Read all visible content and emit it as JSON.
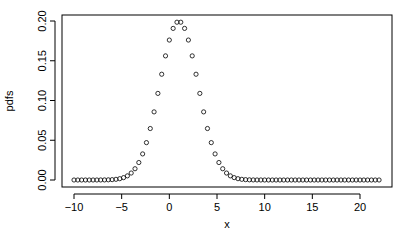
{
  "chart_data": {
    "type": "scatter",
    "title": "",
    "xlabel": "x",
    "ylabel": "pdfs",
    "xlim": [
      -10,
      22
    ],
    "ylim": [
      0,
      0.2
    ],
    "grid": false,
    "legend": null,
    "marker": "open-circle",
    "x_ticks": [
      -10,
      -5,
      0,
      5,
      10,
      15,
      20
    ],
    "x_tick_labels": [
      "−10",
      "−5",
      "0",
      "5",
      "10",
      "15",
      "20"
    ],
    "y_ticks": [
      0.0,
      0.05,
      0.1,
      0.15,
      0.2
    ],
    "y_tick_labels": [
      "0.00",
      "0.05",
      "0.10",
      "0.15",
      "0.20"
    ],
    "series": [
      {
        "name": "pdfs",
        "x": [
          -10.0,
          -9.6,
          -9.2,
          -8.8,
          -8.4,
          -8.0,
          -7.6,
          -7.2,
          -6.8,
          -6.4,
          -6.0,
          -5.6,
          -5.2,
          -4.8,
          -4.4,
          -4.0,
          -3.6,
          -3.2,
          -2.8,
          -2.4,
          -2.0,
          -1.6,
          -1.2,
          -0.8,
          -0.4,
          0.0,
          0.4,
          0.8,
          1.2,
          1.6,
          2.0,
          2.4,
          2.8,
          3.2,
          3.6,
          4.0,
          4.4,
          4.8,
          5.2,
          5.6,
          6.0,
          6.4,
          6.8,
          7.2,
          7.6,
          8.0,
          8.4,
          8.8,
          9.2,
          9.6,
          10.0,
          10.4,
          10.8,
          11.2,
          11.6,
          12.0,
          12.4,
          12.8,
          13.2,
          13.6,
          14.0,
          14.4,
          14.8,
          15.2,
          15.6,
          16.0,
          16.4,
          16.8,
          17.2,
          17.6,
          18.0,
          18.4,
          18.8,
          19.2,
          19.6,
          20.0,
          20.4,
          20.8,
          21.2,
          21.6,
          22.0
        ],
        "y": [
          0.0,
          0.0,
          0.0,
          0.0,
          0.0,
          0.0,
          0.0,
          0.0,
          0.0,
          0.0001,
          0.0002,
          0.0004,
          0.0008,
          0.0015,
          0.003,
          0.0054,
          0.0091,
          0.0146,
          0.0223,
          0.0323,
          0.0443,
          0.0577,
          0.0715,
          0.0842,
          0.0941,
          0.176,
          0.1862,
          0.1941,
          0.1985,
          0.1911,
          0.176,
          0.1541,
          0.133,
          0.1085,
          0.0862,
          0.0648,
          0.047,
          0.0328,
          0.0218,
          0.0139,
          0.0083,
          0.0049,
          0.0027,
          0.0014,
          0.0007,
          0.0003,
          0.0001,
          0.0001,
          0.0,
          0.0,
          0.0,
          0.0,
          0.0,
          0.0,
          0.0,
          0.0,
          0.0,
          0.0,
          0.0,
          0.0,
          0.0,
          0.0,
          0.0,
          0.0,
          0.0,
          0.0,
          0.0,
          0.0,
          0.0,
          0.0,
          0.0,
          0.0,
          0.0,
          0.0,
          0.0,
          0.0,
          0.0,
          0.0,
          0.0,
          0.0,
          0.0
        ],
        "distribution": {
          "family": "normal",
          "mean": 1,
          "sd": 2
        }
      }
    ]
  }
}
